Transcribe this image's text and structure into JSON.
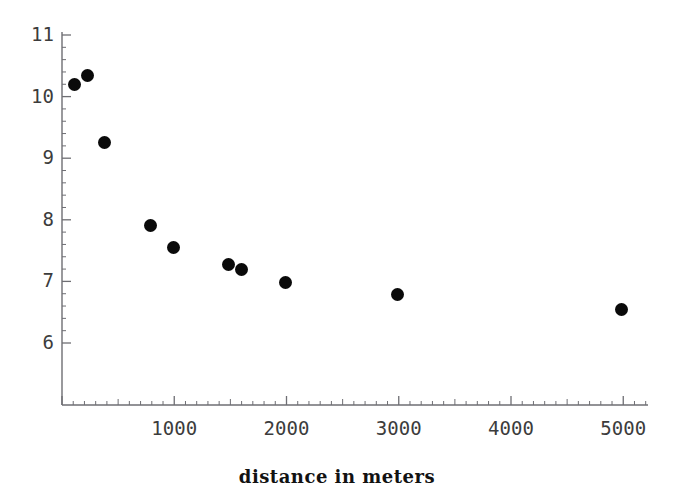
{
  "figure": {
    "ghost_cut_text": "",
    "background_color": "#ffffff",
    "marker_color": "#0a0a0a",
    "axis_color": "#6e6e73"
  },
  "axis": {
    "x_title": "distance in meters",
    "y_title": "",
    "x_tick_labels": [
      "1000",
      "2000",
      "3000",
      "4000",
      "5000"
    ],
    "y_tick_labels": [
      "11",
      "10",
      "9",
      "8",
      "7",
      "6"
    ]
  },
  "chart_data": {
    "type": "scatter",
    "title": "",
    "xlabel": "distance in meters",
    "ylabel": "",
    "xlim": [
      0,
      5220
    ],
    "ylim": [
      5.7,
      11.15
    ],
    "xticks": [
      1000,
      2000,
      3000,
      4000,
      5000
    ],
    "yticks": [
      6,
      7,
      8,
      9,
      10,
      11
    ],
    "x_minor_tick_step": 100,
    "y_minor_tick_step": 0.2,
    "grid": false,
    "legend": false,
    "marker": "filled-circle",
    "marker_size_px": 13,
    "series": [
      {
        "name": "measurements",
        "points": [
          {
            "x": 107,
            "y": 10.19
          },
          {
            "x": 223,
            "y": 10.35
          },
          {
            "x": 383,
            "y": 9.25
          },
          {
            "x": 784,
            "y": 7.91
          },
          {
            "x": 989,
            "y": 7.55
          },
          {
            "x": 1479,
            "y": 7.27
          },
          {
            "x": 1595,
            "y": 7.2
          },
          {
            "x": 1987,
            "y": 6.99
          },
          {
            "x": 2985,
            "y": 6.79
          },
          {
            "x": 4980,
            "y": 6.54
          }
        ]
      }
    ]
  }
}
